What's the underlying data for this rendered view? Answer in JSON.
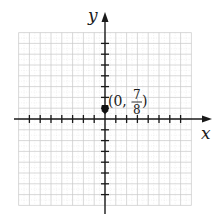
{
  "figure": {
    "x_axis_label": "x",
    "y_axis_label": "y",
    "point": {
      "x": 0,
      "y": 0.875,
      "label_prefix": "(0,",
      "label_num": "7",
      "label_den": "8",
      "label_suffix": ")"
    },
    "grid": {
      "x_min": -8,
      "x_max": 8,
      "y_min": -8,
      "y_max": 8,
      "tick_range": [
        -7,
        7
      ]
    },
    "colors": {
      "axis": "#1a1a1a",
      "grid": "#c8c8c8",
      "point": "#111111"
    }
  },
  "chart_data": {
    "type": "scatter",
    "title": "",
    "xlabel": "x",
    "ylabel": "y",
    "x": [
      0
    ],
    "y": [
      0.875
    ],
    "annotations": [
      "(0, 7/8)"
    ],
    "xlim": [
      -8,
      8
    ],
    "ylim": [
      -8,
      8
    ],
    "xticks": [
      -7,
      -6,
      -5,
      -4,
      -3,
      -2,
      -1,
      1,
      2,
      3,
      4,
      5,
      6,
      7
    ],
    "yticks": [
      -7,
      -6,
      -5,
      -4,
      -3,
      -2,
      -1,
      1,
      2,
      3,
      4,
      5,
      6,
      7
    ],
    "tick_labels_shown": false,
    "grid": true
  }
}
